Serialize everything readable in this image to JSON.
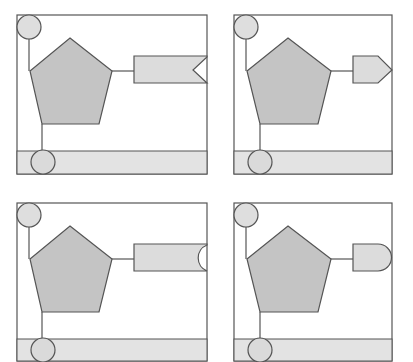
{
  "diagram": {
    "title": "",
    "colors": {
      "background": "#ffffff",
      "stroke": "#555555",
      "pentagon_fill": "#c4c4c4",
      "light_fill": "#dedede",
      "band_fill": "#e3e3e3"
    },
    "panels": [
      {
        "id": "top-left",
        "terminator": "notched-flag",
        "x": 17,
        "y": 15,
        "w": 190,
        "h": 159
      },
      {
        "id": "top-right",
        "terminator": "pointed-arrow",
        "x": 234,
        "y": 15,
        "w": 158,
        "h": 159
      },
      {
        "id": "bottom-left",
        "terminator": "concave-semicircle",
        "x": 17,
        "y": 203,
        "w": 190,
        "h": 158
      },
      {
        "id": "bottom-right",
        "terminator": "convex-semicircle",
        "x": 234,
        "y": 203,
        "w": 158,
        "h": 158
      }
    ]
  }
}
